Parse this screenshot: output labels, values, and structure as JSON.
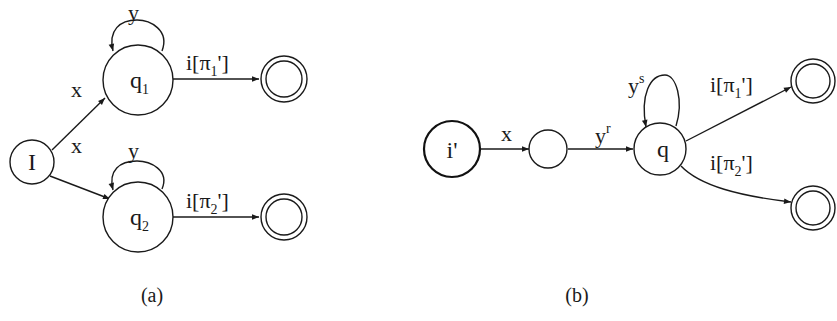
{
  "figure_a": {
    "caption": "(a)",
    "initial_state": {
      "label": "I"
    },
    "states": [
      {
        "name": "q",
        "subscript": "1",
        "self_loop": "y"
      },
      {
        "name": "q",
        "subscript": "2",
        "self_loop": "y"
      }
    ],
    "edges": [
      {
        "from": "I",
        "to": "q1",
        "label": "x"
      },
      {
        "from": "I",
        "to": "q2",
        "label": "x"
      },
      {
        "from": "q1",
        "to": "accept1",
        "label_prefix": "i[π",
        "label_sub": "1",
        "label_suffix": "']"
      },
      {
        "from": "q2",
        "to": "accept2",
        "label_prefix": "i[π",
        "label_sub": "2",
        "label_suffix": "']"
      }
    ],
    "accepting_states": 2
  },
  "figure_b": {
    "caption": "(b)",
    "initial_state": {
      "label": "i'"
    },
    "intermediate_state": {
      "label": ""
    },
    "hub_state": {
      "label": "q",
      "self_loop_base": "y",
      "self_loop_sup": "s"
    },
    "edges": [
      {
        "from": "i'",
        "to": "mid",
        "label": "x"
      },
      {
        "from": "mid",
        "to": "q",
        "label_base": "y",
        "label_sup": "r"
      },
      {
        "from": "q",
        "to": "accept1",
        "label_prefix": "i[π",
        "label_sub": "1",
        "label_suffix": "']"
      },
      {
        "from": "q",
        "to": "accept2",
        "label_prefix": "i[π",
        "label_sub": "2",
        "label_suffix": "']"
      }
    ],
    "accepting_states": 2
  },
  "colors": {
    "stroke": "#1a1a1a",
    "background": "#ffffff"
  }
}
